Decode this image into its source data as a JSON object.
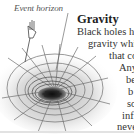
{
  "illustration": {
    "subject": "black-hole-gravity-well",
    "label": "Event horizon"
  },
  "article": {
    "heading": "Gravity",
    "lines": [
      "Black holes hav",
      "gravity whi",
      "that co",
      "Any",
      "be",
      "b",
      "so",
      "inf",
      "neve"
    ]
  },
  "colors": {
    "text": "#333333",
    "heading": "#222222",
    "label": "#555555",
    "grid": "#777777",
    "hole": "#1a1a1a"
  }
}
